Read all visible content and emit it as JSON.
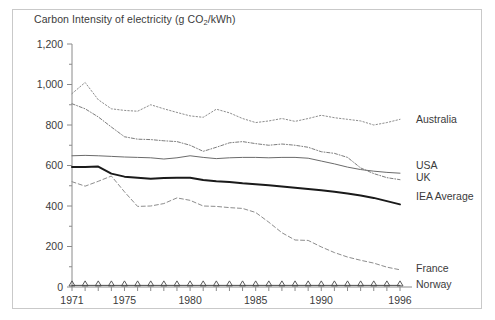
{
  "chart_data": {
    "type": "line",
    "title": "Carbon Intensity of electricity (g CO2/kWh)",
    "title_prefix": "Carbon Intensity of electricity (g CO",
    "title_sub": "2",
    "title_suffix": "/kWh)",
    "xlabel": "",
    "ylabel": "",
    "xlim": [
      1971,
      1996
    ],
    "ylim": [
      0,
      1200
    ],
    "grid": false,
    "legend_position": "inline-right",
    "y_ticks": [
      0,
      200,
      400,
      600,
      800,
      1000,
      1200
    ],
    "y_tick_labels": [
      "0",
      "200",
      "400",
      "600",
      "800",
      "1,000",
      "1,200"
    ],
    "y_minor_ticks": [
      100,
      300,
      500,
      700,
      900,
      1100
    ],
    "x_ticks": [
      1971,
      1972,
      1973,
      1974,
      1975,
      1976,
      1977,
      1978,
      1979,
      1980,
      1981,
      1982,
      1983,
      1984,
      1985,
      1986,
      1987,
      1988,
      1989,
      1990,
      1991,
      1992,
      1993,
      1994,
      1995,
      1996
    ],
    "x_tick_labels": [
      {
        "year": 1971,
        "label": "1971"
      },
      {
        "year": 1975,
        "label": "1975"
      },
      {
        "year": 1980,
        "label": "1980"
      },
      {
        "year": 1985,
        "label": "1985"
      },
      {
        "year": 1990,
        "label": "1990"
      },
      {
        "year": 1996,
        "label": "1996"
      }
    ],
    "x": [
      1971,
      1972,
      1973,
      1974,
      1975,
      1976,
      1977,
      1978,
      1979,
      1980,
      1981,
      1982,
      1983,
      1984,
      1985,
      1986,
      1987,
      1988,
      1989,
      1990,
      1991,
      1992,
      1993,
      1994,
      1995,
      1996
    ],
    "series": [
      {
        "name": "Australia",
        "style": "dotted",
        "color": "#8d8d8d",
        "width": 1,
        "label_value": 830,
        "values": [
          955,
          1010,
          925,
          880,
          872,
          868,
          900,
          880,
          862,
          845,
          838,
          878,
          860,
          832,
          812,
          820,
          832,
          818,
          832,
          848,
          836,
          828,
          820,
          800,
          812,
          828
        ]
      },
      {
        "name": "USA",
        "style": "solid",
        "color": "#6b6b6b",
        "width": 1,
        "label_value": 600,
        "values": [
          648,
          650,
          648,
          645,
          642,
          640,
          638,
          632,
          638,
          648,
          640,
          634,
          638,
          640,
          640,
          638,
          640,
          640,
          636,
          622,
          608,
          592,
          580,
          572,
          566,
          562
        ]
      },
      {
        "name": "UK",
        "style": "dashdot",
        "color": "#7d7d7d",
        "width": 1,
        "label_value": 540,
        "values": [
          905,
          880,
          840,
          790,
          742,
          730,
          728,
          722,
          718,
          700,
          670,
          690,
          712,
          718,
          708,
          700,
          706,
          700,
          690,
          668,
          660,
          640,
          588,
          560,
          540,
          530
        ]
      },
      {
        "name": "IEA Average",
        "style": "solid",
        "color": "#1a1a1a",
        "width": 2,
        "label_value": 450,
        "values": [
          592,
          592,
          595,
          560,
          545,
          540,
          535,
          538,
          540,
          540,
          528,
          522,
          518,
          512,
          508,
          502,
          496,
          490,
          484,
          478,
          470,
          462,
          452,
          440,
          424,
          408
        ]
      },
      {
        "name": "France",
        "style": "dashed",
        "color": "#8d8d8d",
        "width": 1,
        "label_value": 95,
        "values": [
          520,
          498,
          522,
          548,
          470,
          398,
          400,
          412,
          440,
          428,
          400,
          398,
          392,
          388,
          368,
          320,
          268,
          232,
          230,
          198,
          170,
          148,
          132,
          118,
          98,
          85
        ]
      },
      {
        "name": "Norway",
        "style": "solid-markers",
        "color": "#4a4a4a",
        "width": 1,
        "label_value": 12,
        "values": [
          8,
          8,
          8,
          8,
          8,
          8,
          8,
          8,
          8,
          8,
          8,
          8,
          8,
          8,
          8,
          8,
          8,
          8,
          8,
          8,
          8,
          8,
          8,
          8,
          8,
          8
        ]
      }
    ]
  }
}
